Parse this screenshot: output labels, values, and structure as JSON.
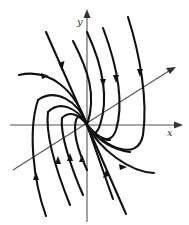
{
  "diagram": {
    "type": "phase-portrait",
    "axes": {
      "x_label": "x",
      "y_label": "y"
    },
    "colors": {
      "trajectory": "#111111",
      "axis": "#555555",
      "background": "#ffffff"
    }
  }
}
